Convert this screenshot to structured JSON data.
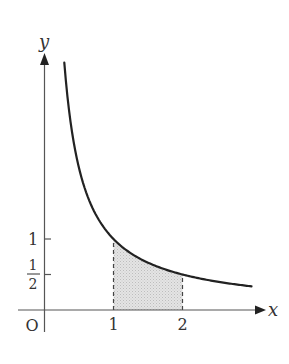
{
  "figure": {
    "type": "graph of y = 1/x with shaded area",
    "axes": {
      "x_label": "x",
      "y_label": "y",
      "origin_label": "O"
    },
    "x_ticks": [
      {
        "value": 1,
        "label": "1"
      },
      {
        "value": 2,
        "label": "2"
      }
    ],
    "y_ticks": [
      {
        "value": 1,
        "label": "1"
      },
      {
        "value": 0.5,
        "label_num": "1",
        "label_den": "2"
      }
    ],
    "curve": {
      "function": "y = 1/x",
      "x_range": [
        0.287,
        3.0
      ]
    },
    "shaded_region": {
      "x_from": 1,
      "x_to": 2,
      "fill": "#d9d9d9"
    },
    "colors": {
      "axis": "#555555",
      "curve": "#222222",
      "dashed": "#444444",
      "shade": "#d9d9d9"
    }
  }
}
